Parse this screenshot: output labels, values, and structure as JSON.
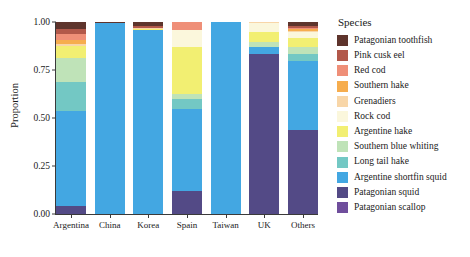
{
  "chart_data": {
    "type": "bar",
    "stacked": true,
    "normalized": true,
    "title": "",
    "xlabel": "",
    "ylabel": "Proportion",
    "ylim": [
      0,
      1
    ],
    "yticks": [
      "0.00",
      "0.25",
      "0.50",
      "0.75",
      "1.00"
    ],
    "ytick_values": [
      0,
      0.25,
      0.5,
      0.75,
      1
    ],
    "grid": false,
    "legend_title": "Species",
    "legend_position": "right",
    "categories": [
      "Argentina",
      "China",
      "Korea",
      "Spain",
      "Taiwan",
      "UK",
      "Others"
    ],
    "series": [
      {
        "name": "Patagonian toothfish",
        "color": "#5e342c",
        "values": [
          0.035,
          0.004,
          0.022,
          0.0,
          0.0,
          0.0,
          0.018
        ]
      },
      {
        "name": "Pink cusk eel",
        "color": "#b2584a",
        "values": [
          0.028,
          0.0,
          0.008,
          0.0,
          0.0,
          0.0,
          0.012
        ]
      },
      {
        "name": "Red cod",
        "color": "#ef8f78",
        "values": [
          0.028,
          0.0,
          0.0,
          0.042,
          0.0,
          0.0,
          0.008
        ]
      },
      {
        "name": "Southern hake",
        "color": "#f6ad4e",
        "values": [
          0.022,
          0.0,
          0.0,
          0.0,
          0.0,
          0.0,
          0.006
        ]
      },
      {
        "name": "Grenadiers",
        "color": "#f8d6a8",
        "values": [
          0.012,
          0.0,
          0.006,
          0.0,
          0.0,
          0.006,
          0.008
        ]
      },
      {
        "name": "Rock cod",
        "color": "#fbf7dc",
        "values": [
          0.0,
          0.0,
          0.0,
          0.088,
          0.0,
          0.046,
          0.03
        ]
      },
      {
        "name": "Argentine hake",
        "color": "#f2ef72",
        "values": [
          0.06,
          0.0,
          0.006,
          0.246,
          0.0,
          0.052,
          0.048
        ]
      },
      {
        "name": "Southern blue whiting",
        "color": "#bfe3b8",
        "values": [
          0.125,
          0.0,
          0.0,
          0.024,
          0.0,
          0.028,
          0.036
        ]
      },
      {
        "name": "Long tail hake",
        "color": "#73c8c4",
        "values": [
          0.155,
          0.0,
          0.0,
          0.052,
          0.0,
          0.0,
          0.038
        ]
      },
      {
        "name": "Argentine shortfin squid",
        "color": "#43a7e2",
        "values": [
          0.495,
          0.996,
          0.958,
          0.43,
          1.0,
          0.032,
          0.36
        ]
      },
      {
        "name": "Patagonian squid",
        "color": "#534a86",
        "values": [
          0.04,
          0.0,
          0.0,
          0.118,
          0.0,
          0.836,
          0.436
        ]
      },
      {
        "name": "Patagonian scallop",
        "color": "#6f4e9c",
        "values": [
          0.0,
          0.0,
          0.0,
          0.0,
          0.0,
          0.0,
          0.0
        ]
      }
    ]
  }
}
